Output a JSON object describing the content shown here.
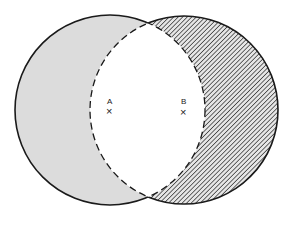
{
  "diagram": {
    "type": "overlapping-circles",
    "colors": {
      "stroke": "#1a1a1a",
      "fill_a": "#dcdcdc",
      "hatch": "#3a3a3a",
      "background": "#ffffff"
    },
    "circle_a": {
      "label": "A",
      "cx": 110,
      "cy": 110,
      "r": 95
    },
    "circle_b": {
      "label": "B",
      "cx": 184,
      "cy": 110,
      "r": 94
    },
    "markers": [
      {
        "label": "A",
        "symbol": "×",
        "x": 110,
        "y": 111
      },
      {
        "label": "B",
        "symbol": "×",
        "x": 184,
        "y": 112
      }
    ]
  }
}
